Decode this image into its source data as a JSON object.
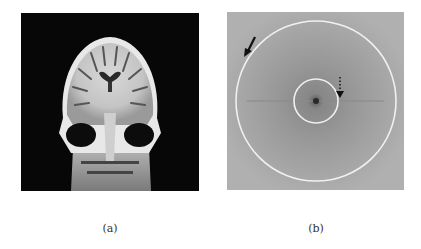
{
  "figure": {
    "panels": [
      {
        "id": "a",
        "caption": "(a)",
        "content": "coronal MRI brain slice",
        "background_color": "#070707"
      },
      {
        "id": "b",
        "caption": "(b)",
        "content": "Fourier magnitude spectrum with two concentric circles",
        "background_color": "#a9a9a9",
        "annotations": [
          {
            "type": "solid-arrow",
            "points_to": "outer circle"
          },
          {
            "type": "dotted-arrow",
            "points_to": "inner circle"
          }
        ],
        "circles": [
          {
            "name": "inner",
            "color": "#f2f2f2"
          },
          {
            "name": "outer",
            "color": "#f2f2f2"
          }
        ]
      }
    ]
  }
}
